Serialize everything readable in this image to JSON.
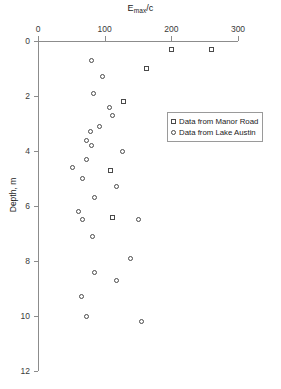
{
  "chart_data": {
    "type": "scatter",
    "title": "",
    "xlabel": "Emax/c",
    "xlabel_base": "E",
    "xlabel_sub": "max",
    "xlabel_tail": "/c",
    "ylabel": "Depth, m",
    "xlim": [
      0,
      300
    ],
    "ylim": [
      0,
      12
    ],
    "y_inverted": true,
    "grid": false,
    "x_ticks": [
      0,
      100,
      200,
      300
    ],
    "y_ticks": [
      0,
      2,
      4,
      6,
      8,
      10,
      12
    ],
    "legend_position": "upper-right-inside",
    "series": [
      {
        "name": "Data from Manor Road",
        "marker": "square",
        "points": [
          {
            "x": 200,
            "y": 0.3
          },
          {
            "x": 260,
            "y": 0.3
          },
          {
            "x": 163,
            "y": 1.0
          },
          {
            "x": 128,
            "y": 2.2
          },
          {
            "x": 108,
            "y": 4.7
          },
          {
            "x": 112,
            "y": 6.4
          }
        ]
      },
      {
        "name": "Data from Lake Austin",
        "marker": "circle",
        "points": [
          {
            "x": 80,
            "y": 0.7
          },
          {
            "x": 96,
            "y": 1.3
          },
          {
            "x": 83,
            "y": 1.9
          },
          {
            "x": 107,
            "y": 2.4
          },
          {
            "x": 112,
            "y": 2.7
          },
          {
            "x": 92,
            "y": 3.1
          },
          {
            "x": 78,
            "y": 3.3
          },
          {
            "x": 73,
            "y": 3.6
          },
          {
            "x": 80,
            "y": 3.8
          },
          {
            "x": 127,
            "y": 4.0
          },
          {
            "x": 72,
            "y": 4.3
          },
          {
            "x": 52,
            "y": 4.6
          },
          {
            "x": 66,
            "y": 5.0
          },
          {
            "x": 118,
            "y": 5.3
          },
          {
            "x": 84,
            "y": 5.7
          },
          {
            "x": 60,
            "y": 6.2
          },
          {
            "x": 66,
            "y": 6.5
          },
          {
            "x": 150,
            "y": 6.5
          },
          {
            "x": 82,
            "y": 7.1
          },
          {
            "x": 139,
            "y": 7.9
          },
          {
            "x": 85,
            "y": 8.4
          },
          {
            "x": 118,
            "y": 8.7
          },
          {
            "x": 65,
            "y": 9.3
          },
          {
            "x": 72,
            "y": 10.0
          },
          {
            "x": 155,
            "y": 10.2
          }
        ]
      }
    ]
  },
  "legend": {
    "items": [
      {
        "label": "Data from Manor Road",
        "marker": "square"
      },
      {
        "label": "Data from Lake Austin",
        "marker": "circle"
      }
    ]
  }
}
